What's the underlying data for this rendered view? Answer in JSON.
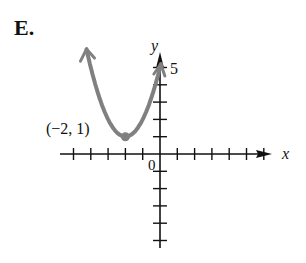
{
  "figure": {
    "label": "E."
  },
  "chart_data": {
    "type": "line",
    "title": "",
    "function": "y = (x + 2)^2 + 1",
    "xlabel": "x",
    "ylabel": "y",
    "xlim": [
      -6,
      7
    ],
    "ylim": [
      -5,
      6
    ],
    "x_ticks": [
      -5,
      -4,
      -3,
      -2,
      -1,
      1,
      2,
      3,
      4,
      5,
      6
    ],
    "y_ticks": [
      -5,
      -4,
      -3,
      -2,
      -1,
      1,
      2,
      3,
      4,
      5
    ],
    "tick_labels": {
      "origin": "0",
      "y5": "5"
    },
    "vertex": {
      "x": -2,
      "y": 1,
      "label": "(−2, 1)"
    },
    "series": [
      {
        "name": "parabola",
        "x": [
          -4.2,
          -4,
          -3,
          -2,
          -1,
          0,
          0.1
        ],
        "y": [
          5.84,
          5,
          2,
          1,
          2,
          5,
          5.41
        ]
      }
    ],
    "grid": false,
    "curve_color": "#808080",
    "axis_color": "#111111"
  }
}
